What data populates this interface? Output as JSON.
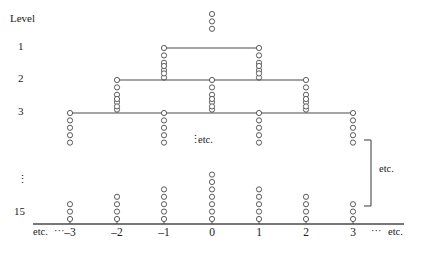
{
  "figure": {
    "title_label": "Level",
    "type": "tree-diagram-with-dot-columns",
    "level_labels": [
      "1",
      "2",
      "3",
      "15"
    ],
    "vertical_dots_symbol": "⋮",
    "etc_text": "etc.",
    "left_axis_etc": "etc.",
    "left_axis_dots": "···",
    "right_axis_dots": "···",
    "right_axis_etc": "etc.",
    "middle_etc_dots": "⋮",
    "middle_etc_text": "etc.",
    "brace_label": "etc.",
    "colors": {
      "stroke": "#4a4a4a",
      "axis": "#4a4a4a",
      "text": "#1a1a1a",
      "background": "#ffffff"
    }
  },
  "axis": {
    "y_pixel": 224,
    "x_start": 33,
    "x_end": 404,
    "tick_labels": [
      "-3",
      "-2",
      "-1",
      "0",
      "1",
      "2",
      "3"
    ],
    "tick_values": [
      -3,
      -2,
      -1,
      0,
      1,
      2,
      3
    ],
    "tick_x_pixels": [
      70,
      117,
      164,
      212,
      259,
      306,
      353
    ],
    "tick_mark_height": 8
  },
  "levels": [
    {
      "label": "1",
      "label_y": 47,
      "line_y": 48,
      "line_x1": 164,
      "line_x2": 259,
      "node_x": [
        164,
        259
      ],
      "stack_counts": [
        5,
        5
      ],
      "stack_direction": "down"
    },
    {
      "label": "2",
      "label_y": 79,
      "line_y": 80,
      "line_x1": 117,
      "line_x2": 306,
      "node_x": [
        117,
        212,
        306
      ],
      "stack_counts": [
        5,
        5,
        5
      ],
      "stack_direction": "down"
    },
    {
      "label": "3",
      "label_y": 112,
      "line_y": 113,
      "line_x1": 70,
      "line_x2": 353,
      "node_x": [
        70,
        164,
        259,
        353
      ],
      "stack_counts": [
        5,
        5,
        5,
        5
      ],
      "stack_direction": "down"
    },
    {
      "label": "15",
      "label_y": 212,
      "baseline_y": 224,
      "node_x": [
        70,
        117,
        164,
        212,
        259,
        306,
        353
      ],
      "stack_counts": [
        3,
        4,
        5,
        7,
        5,
        4,
        3
      ],
      "stack_direction": "up"
    }
  ],
  "upper_stubs": [
    {
      "x": 212,
      "y_top": 14,
      "count": 3,
      "note": "above level 1 line"
    },
    {
      "x": 164,
      "y_top": 66,
      "count": 2,
      "note": "above level 2 line at -1"
    },
    {
      "x": 259,
      "y_top": 66,
      "count": 2,
      "note": "above level 2 line at 1"
    },
    {
      "x": 117,
      "y_top": 99,
      "count": 2,
      "note": "above level 3 line at -2"
    },
    {
      "x": 212,
      "y_top": 99,
      "count": 2,
      "note": "above level 3 line at 0"
    },
    {
      "x": 306,
      "y_top": 99,
      "count": 2,
      "note": "above level 3 line at 2"
    }
  ],
  "brace": {
    "x": 371,
    "y_top": 140,
    "y_bottom": 206,
    "tip_width": 7,
    "label": "etc.",
    "label_x": 379,
    "label_y": 168
  },
  "annotations": [
    {
      "name": "level-head",
      "text": "Level",
      "x": 10,
      "y": 13
    },
    {
      "name": "vertical-ellipsis-left",
      "text": "⋮",
      "x": 17,
      "y": 180
    },
    {
      "name": "middle-etc",
      "text": "⋮ etc.",
      "x": 188,
      "y": 140
    },
    {
      "name": "axis-left-etc",
      "text": "etc. ···",
      "x": 33,
      "y": 232
    },
    {
      "name": "axis-right-etc",
      "text": "··· etc.",
      "x": 372,
      "y": 232
    }
  ]
}
